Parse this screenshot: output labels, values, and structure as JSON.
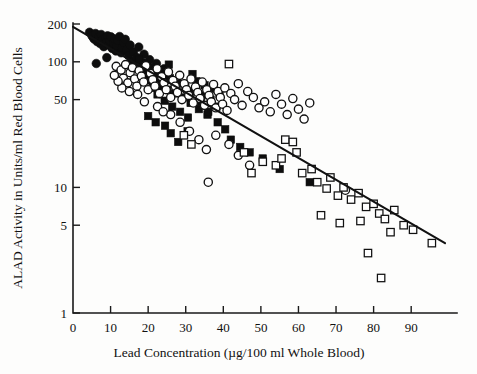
{
  "chart_data": {
    "type": "scatter",
    "title": "",
    "xlabel": "Lead Concentration (µg/100 ml Whole Blood)",
    "ylabel": "ALAD Activity in Units/ml Red Blood Cells",
    "xscale": "linear",
    "yscale": "log",
    "xlim": [
      0,
      99
    ],
    "ylim": [
      1,
      200
    ],
    "grid": false,
    "legend": "none",
    "xticks": [
      0,
      10,
      20,
      30,
      40,
      50,
      60,
      70,
      80,
      90
    ],
    "xtick_labels": [
      "0",
      "10",
      "20",
      "30",
      "40",
      "50",
      "60",
      "70",
      "80",
      "90"
    ],
    "yticks": [
      1,
      5,
      10,
      50,
      100,
      200
    ],
    "ytick_labels": [
      "1",
      "5",
      "10",
      "50",
      "100",
      "200"
    ],
    "trendline": {
      "name": "regression-line",
      "x_start": 0,
      "y_start": 190,
      "x_end": 99,
      "y_end": 3.6
    },
    "series": [
      {
        "name": "Group A",
        "marker": "filled-circle",
        "points": [
          [
            4.4,
            172
          ],
          [
            5.1,
            160
          ],
          [
            5.6,
            152
          ],
          [
            6.0,
            168
          ],
          [
            6.4,
            145
          ],
          [
            6.9,
            158
          ],
          [
            7.2,
            140
          ],
          [
            7.5,
            165
          ],
          [
            7.9,
            150
          ],
          [
            8.2,
            132
          ],
          [
            8.6,
            155
          ],
          [
            8.9,
            143
          ],
          [
            9.2,
            161
          ],
          [
            9.5,
            136
          ],
          [
            9.8,
            148
          ],
          [
            10.1,
            158
          ],
          [
            10.4,
            128
          ],
          [
            10.8,
            141
          ],
          [
            11.1,
            152
          ],
          [
            11.4,
            122
          ],
          [
            11.7,
            135
          ],
          [
            12.0,
            147
          ],
          [
            12.4,
            159
          ],
          [
            12.8,
            118
          ],
          [
            13.1,
            130
          ],
          [
            13.5,
            142
          ],
          [
            6.2,
            97
          ],
          [
            9.0,
            108
          ],
          [
            13.9,
            151
          ],
          [
            14.3,
            124
          ],
          [
            14.8,
            112
          ],
          [
            15.2,
            136
          ],
          [
            15.6,
            101
          ],
          [
            16.1,
            120
          ],
          [
            16.5,
            91
          ],
          [
            17.0,
            108
          ],
          [
            17.5,
            131
          ],
          [
            18.0,
            84
          ],
          [
            18.4,
            99
          ],
          [
            18.9,
            115
          ],
          [
            19.4,
            76
          ],
          [
            19.9,
            92
          ],
          [
            20.4,
            104
          ],
          [
            21.0,
            70
          ],
          [
            21.6,
            86
          ],
          [
            22.2,
            97
          ],
          [
            22.9,
            79
          ],
          [
            23.5,
            64
          ],
          [
            24.2,
            88
          ],
          [
            25.0,
            72
          ]
        ]
      },
      {
        "name": "Group B",
        "marker": "filled-square",
        "points": [
          [
            18.8,
            97
          ],
          [
            19.4,
            83
          ],
          [
            20.1,
            71
          ],
          [
            20.7,
            90
          ],
          [
            21.3,
            62
          ],
          [
            21.9,
            78
          ],
          [
            22.5,
            55
          ],
          [
            23.2,
            68
          ],
          [
            23.8,
            86
          ],
          [
            24.4,
            49
          ],
          [
            25.1,
            60
          ],
          [
            25.8,
            74
          ],
          [
            26.4,
            44
          ],
          [
            27.1,
            56
          ],
          [
            27.8,
            67
          ],
          [
            28.5,
            40
          ],
          [
            29.2,
            52
          ],
          [
            29.9,
            63
          ],
          [
            30.6,
            36
          ],
          [
            31.3,
            47
          ],
          [
            32.0,
            58
          ],
          [
            32.8,
            70
          ],
          [
            33.5,
            42
          ],
          [
            34.3,
            54
          ],
          [
            35.0,
            65
          ],
          [
            35.8,
            38
          ],
          [
            36.6,
            50
          ],
          [
            37.4,
            61
          ],
          [
            38.2,
            44
          ],
          [
            39.0,
            55
          ],
          [
            20.0,
            37
          ],
          [
            22.0,
            33
          ],
          [
            24.5,
            31
          ],
          [
            26.0,
            27
          ],
          [
            28.0,
            23
          ],
          [
            30.5,
            28
          ],
          [
            34.0,
            48
          ],
          [
            36.0,
            40
          ],
          [
            38.5,
            33
          ],
          [
            40.5,
            29
          ],
          [
            42.0,
            24
          ],
          [
            44.5,
            21
          ],
          [
            47.0,
            19
          ],
          [
            50.5,
            17
          ],
          [
            55.0,
            14
          ],
          [
            63.0,
            11
          ],
          [
            17.5,
            104
          ],
          [
            16.8,
            89
          ],
          [
            25.5,
            95
          ],
          [
            31.8,
            80
          ]
        ]
      },
      {
        "name": "Group C",
        "marker": "open-circle",
        "points": [
          [
            11.5,
            92
          ],
          [
            12.2,
            80
          ],
          [
            12.8,
            86
          ],
          [
            13.4,
            74
          ],
          [
            14.0,
            95
          ],
          [
            14.6,
            68
          ],
          [
            15.2,
            82
          ],
          [
            15.8,
            90
          ],
          [
            16.4,
            73
          ],
          [
            17.0,
            64
          ],
          [
            17.6,
            85
          ],
          [
            18.2,
            77
          ],
          [
            18.8,
            69
          ],
          [
            19.4,
            93
          ],
          [
            20.0,
            60
          ],
          [
            20.6,
            81
          ],
          [
            21.2,
            72
          ],
          [
            21.8,
            64
          ],
          [
            22.4,
            88
          ],
          [
            23.0,
            56
          ],
          [
            23.6,
            76
          ],
          [
            24.2,
            68
          ],
          [
            24.8,
            60
          ],
          [
            25.4,
            83
          ],
          [
            26.0,
            52
          ],
          [
            26.6,
            71
          ],
          [
            27.2,
            64
          ],
          [
            27.8,
            57
          ],
          [
            28.4,
            78
          ],
          [
            29.0,
            50
          ],
          [
            29.6,
            67
          ],
          [
            30.2,
            60
          ],
          [
            30.8,
            54
          ],
          [
            31.4,
            73
          ],
          [
            32.0,
            47
          ],
          [
            32.6,
            63
          ],
          [
            33.2,
            57
          ],
          [
            33.8,
            51
          ],
          [
            34.4,
            69
          ],
          [
            35.0,
            45
          ],
          [
            35.6,
            60
          ],
          [
            36.2,
            54
          ],
          [
            36.8,
            48
          ],
          [
            37.4,
            66
          ],
          [
            38.0,
            43
          ],
          [
            38.6,
            58
          ],
          [
            39.2,
            52
          ],
          [
            39.8,
            46
          ],
          [
            40.4,
            62
          ],
          [
            41.0,
            41
          ],
          [
            42.0,
            56
          ],
          [
            43.0,
            50
          ],
          [
            44.0,
            67
          ],
          [
            45.0,
            45
          ],
          [
            46.5,
            58
          ],
          [
            48.0,
            52
          ],
          [
            49.5,
            43
          ],
          [
            51.0,
            48
          ],
          [
            52.5,
            40
          ],
          [
            54.0,
            55
          ],
          [
            55.5,
            46
          ],
          [
            57.0,
            38
          ],
          [
            58.5,
            51
          ],
          [
            60.0,
            42
          ],
          [
            61.5,
            35
          ],
          [
            63.0,
            47
          ],
          [
            26.0,
            38
          ],
          [
            28.5,
            33
          ],
          [
            31.0,
            28
          ],
          [
            33.5,
            24
          ],
          [
            35.5,
            20
          ],
          [
            38.0,
            26
          ],
          [
            41.5,
            22
          ],
          [
            44.0,
            18
          ],
          [
            47.0,
            15
          ],
          [
            36.0,
            11
          ],
          [
            72.5,
            9.5
          ],
          [
            22.5,
            44
          ],
          [
            24.0,
            40
          ],
          [
            19.0,
            48
          ],
          [
            17.2,
            55
          ],
          [
            15.0,
            58
          ],
          [
            13.0,
            62
          ],
          [
            12.0,
            70
          ],
          [
            11.0,
            78
          ]
        ]
      },
      {
        "name": "Group D",
        "marker": "open-square",
        "points": [
          [
            41.5,
            96
          ],
          [
            29.5,
            26
          ],
          [
            31.5,
            22
          ],
          [
            56.5,
            24
          ],
          [
            58.5,
            23
          ],
          [
            59.5,
            19
          ],
          [
            54.0,
            15
          ],
          [
            55.5,
            17
          ],
          [
            61.0,
            13
          ],
          [
            63.5,
            14
          ],
          [
            65.0,
            11
          ],
          [
            67.5,
            9.8
          ],
          [
            68.5,
            12
          ],
          [
            70.5,
            8.6
          ],
          [
            72.0,
            10
          ],
          [
            74.0,
            8.0
          ],
          [
            76.0,
            9.0
          ],
          [
            78.0,
            7.0
          ],
          [
            80.0,
            7.4
          ],
          [
            81.5,
            6.2
          ],
          [
            83.0,
            5.6
          ],
          [
            84.5,
            4.4
          ],
          [
            85.5,
            6.6
          ],
          [
            88.0,
            5.0
          ],
          [
            90.5,
            4.6
          ],
          [
            95.5,
            3.6
          ],
          [
            78.5,
            3.0
          ],
          [
            82.0,
            1.9
          ],
          [
            50.5,
            16
          ],
          [
            45.5,
            19
          ],
          [
            66.0,
            6.0
          ],
          [
            71.0,
            5.2
          ],
          [
            76.5,
            5.4
          ],
          [
            47.5,
            13
          ]
        ]
      }
    ]
  }
}
